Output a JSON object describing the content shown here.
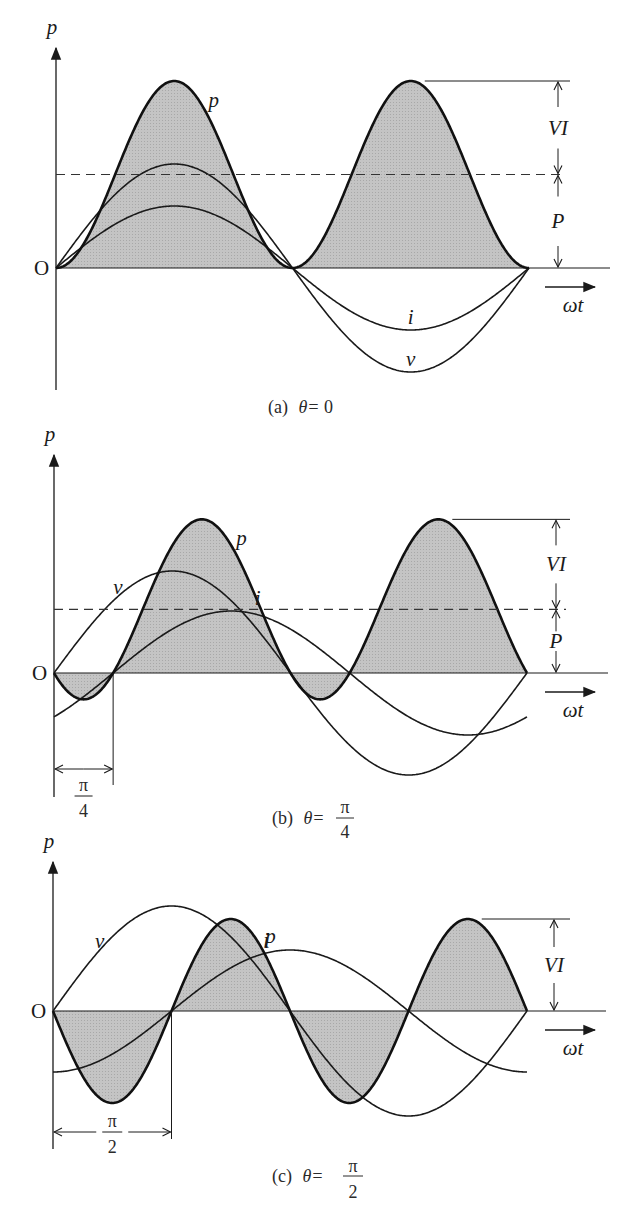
{
  "figure": {
    "panels": [
      {
        "id": "a",
        "caption_prefix": "(a)",
        "caption_theta": "θ=",
        "caption_value": "0",
        "caption_frac": null,
        "labels": {
          "p_axis": "p",
          "origin": "O",
          "p_curve": "p",
          "i_curve": "i",
          "v_curve": "v",
          "VI": "VI",
          "P": "P",
          "wt": "ωt"
        }
      },
      {
        "id": "b",
        "caption_prefix": "(b)",
        "caption_theta": "θ=",
        "caption_frac": {
          "num": "π",
          "den": "4"
        },
        "labels": {
          "p_axis": "p",
          "origin": "O",
          "p_curve": "p",
          "i_curve": "i",
          "v_curve": "v",
          "VI": "VI",
          "P": "P",
          "wt": "ωt",
          "shift_num": "π",
          "shift_den": "4"
        }
      },
      {
        "id": "c",
        "caption_prefix": "(c)",
        "caption_theta": "θ=",
        "caption_frac": {
          "num": "π",
          "den": "2"
        },
        "labels": {
          "p_axis": "p",
          "origin": "O",
          "p_curve": "p",
          "i_curve": "i",
          "v_curve": "v",
          "VI": "VI",
          "wt": "ωt",
          "shift_num": "π",
          "shift_den": "2"
        }
      }
    ]
  },
  "chart_data": [
    {
      "type": "line",
      "title": "(a) θ=0",
      "xlabel": "ωt",
      "ylabel": "p",
      "x_range": [
        0,
        6.2832
      ],
      "theta": 0,
      "series": [
        {
          "name": "v",
          "formula": "V·sin(ωt)",
          "amplitude_rel": 1.11
        },
        {
          "name": "i",
          "formula": "I·sin(ωt−θ)",
          "amplitude_rel": 0.66
        },
        {
          "name": "p",
          "formula": "VI·cosθ − VI·cos(2ωt−θ)",
          "peak_rel": 2.0,
          "shaded": true
        }
      ],
      "annotations": [
        "VI",
        "P (dashed average power line)"
      ]
    },
    {
      "type": "line",
      "title": "(b) θ=π/4",
      "xlabel": "ωt",
      "ylabel": "p",
      "x_range": [
        0,
        6.2832
      ],
      "theta": 0.7854,
      "series": [
        {
          "name": "v",
          "formula": "V·sin(ωt)",
          "amplitude_rel": 1.13
        },
        {
          "name": "i",
          "formula": "I·sin(ωt−π/4)",
          "amplitude_rel": 0.69
        },
        {
          "name": "p",
          "formula": "VI·cosθ − VI·cos(2ωt−θ)",
          "peak_rel": 1.707,
          "shaded": true
        }
      ],
      "annotations": [
        "VI",
        "P (dashed average power line)",
        "π/4 phase shift"
      ]
    },
    {
      "type": "line",
      "title": "(c) θ=π/2",
      "xlabel": "ωt",
      "ylabel": "p",
      "x_range": [
        0,
        6.2832
      ],
      "theta": 1.5708,
      "series": [
        {
          "name": "v",
          "formula": "V·sin(ωt)",
          "amplitude_rel": 1.14
        },
        {
          "name": "i",
          "formula": "I·sin(ωt−π/2)",
          "amplitude_rel": 0.66
        },
        {
          "name": "p",
          "formula": "−VI·cos(2ωt−π/2)",
          "peak_rel": 1.0,
          "shaded": true
        }
      ],
      "annotations": [
        "VI",
        "π/2 phase shift",
        "P = 0"
      ]
    }
  ],
  "geometry": [
    {
      "ox": 56,
      "base": 268,
      "end": 529,
      "VI": 93.5,
      "vA": 104,
      "iA": 62,
      "theta": 0,
      "axisTop": 48,
      "axisBot": 390,
      "lineEnd": 610,
      "i_end": 6.2832
    },
    {
      "ox": 54,
      "base": 673,
      "end": 527,
      "VI": 90,
      "vA": 102,
      "iA": 62,
      "theta": 0.7854,
      "axisTop": 455,
      "axisBot": 797,
      "lineEnd": 608,
      "i_end": 6.2832
    },
    {
      "ox": 53,
      "base": 1011,
      "end": 527,
      "VI": 92,
      "vA": 105,
      "iA": 61,
      "theta": 1.5708,
      "axisTop": 862,
      "axisBot": 1149,
      "lineEnd": 606,
      "i_end": 6.2832
    }
  ]
}
